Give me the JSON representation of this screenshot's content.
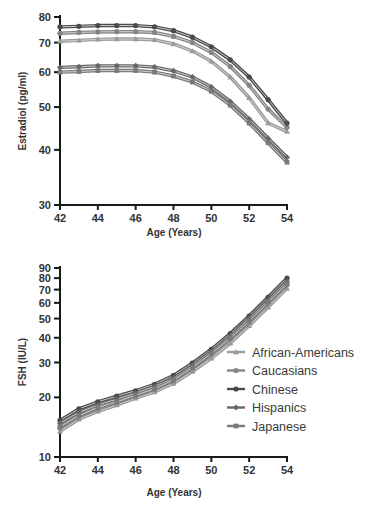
{
  "chart_data": [
    {
      "type": "line",
      "title": "",
      "xlabel": "Age (Years)",
      "ylabel": "Estradiol (pg/ml)",
      "yscale": "log",
      "xlim": [
        42,
        54
      ],
      "ylim": [
        30,
        80
      ],
      "xticks": [
        42,
        44,
        46,
        48,
        50,
        52,
        54
      ],
      "yticks": [
        30,
        40,
        50,
        60,
        70,
        80
      ],
      "grid": false,
      "x": [
        42,
        43,
        44,
        45,
        46,
        47,
        48,
        49,
        50,
        51,
        52,
        53,
        54
      ],
      "series": [
        {
          "name": "African-Americans",
          "values": [
            70.5,
            70.8,
            71.2,
            71.3,
            71.3,
            71.0,
            69.5,
            67.0,
            63.5,
            58.5,
            52.5,
            46.0,
            44.0
          ]
        },
        {
          "name": "Caucasians",
          "values": [
            73.5,
            73.8,
            74.0,
            74.1,
            74.1,
            73.8,
            72.3,
            70.0,
            66.5,
            61.8,
            56.0,
            49.5,
            45.0
          ]
        },
        {
          "name": "Chinese",
          "values": [
            76.0,
            76.2,
            76.5,
            76.5,
            76.5,
            76.0,
            74.5,
            72.0,
            68.5,
            64.0,
            58.5,
            52.0,
            46.0
          ]
        },
        {
          "name": "Hispanics",
          "values": [
            61.5,
            61.7,
            62.0,
            62.0,
            62.0,
            61.6,
            60.4,
            58.5,
            55.5,
            51.5,
            47.0,
            42.5,
            38.5
          ]
        },
        {
          "name": "Japanese",
          "values": [
            60.0,
            60.2,
            60.5,
            60.5,
            60.5,
            60.0,
            58.8,
            57.0,
            54.3,
            50.5,
            46.0,
            41.5,
            37.5
          ]
        }
      ]
    },
    {
      "type": "line",
      "title": "",
      "xlabel": "Age (Years)",
      "ylabel": "FSH (IU/L)",
      "yscale": "log",
      "xlim": [
        42,
        54
      ],
      "ylim": [
        10,
        90
      ],
      "xticks": [
        42,
        44,
        46,
        48,
        50,
        52,
        54
      ],
      "yticks": [
        10,
        20,
        30,
        40,
        50,
        60,
        70,
        80,
        90
      ],
      "grid": false,
      "legend": "right",
      "x": [
        42,
        43,
        44,
        45,
        46,
        47,
        48,
        49,
        50,
        51,
        52,
        53,
        54
      ],
      "series": [
        {
          "name": "African-Americans",
          "values": [
            13.5,
            15.5,
            17.0,
            18.3,
            19.8,
            21.3,
            23.5,
            27.0,
            31.5,
            37.5,
            46.0,
            57.0,
            71.0
          ]
        },
        {
          "name": "Caucasians",
          "values": [
            14.0,
            16.0,
            17.5,
            18.8,
            20.3,
            22.0,
            24.3,
            28.0,
            33.0,
            39.5,
            48.0,
            60.0,
            74.0
          ]
        },
        {
          "name": "Chinese",
          "values": [
            15.3,
            17.5,
            19.0,
            20.3,
            21.6,
            23.3,
            25.8,
            29.8,
            35.0,
            42.0,
            51.5,
            64.0,
            80.0
          ]
        },
        {
          "name": "Hispanics",
          "values": [
            14.8,
            16.8,
            18.3,
            19.6,
            21.0,
            22.7,
            25.0,
            29.0,
            34.0,
            40.8,
            50.0,
            62.0,
            77.0
          ]
        },
        {
          "name": "Japanese",
          "values": [
            14.2,
            16.2,
            17.8,
            19.0,
            20.5,
            22.1,
            24.5,
            28.3,
            33.3,
            39.8,
            48.5,
            60.5,
            75.0
          ]
        }
      ]
    }
  ],
  "legend": {
    "items": [
      {
        "label": "African-Americans",
        "color": "#9a9a9a",
        "marker": "triangle"
      },
      {
        "label": "Caucasians",
        "color": "#858585",
        "marker": "circle"
      },
      {
        "label": "Chinese",
        "color": "#4a4a4a",
        "marker": "circle"
      },
      {
        "label": "Hispanics",
        "color": "#666666",
        "marker": "diamond"
      },
      {
        "label": "Japanese",
        "color": "#7a7a7a",
        "marker": "square"
      }
    ]
  },
  "colors": {
    "African-Americans": "#9a9a9a",
    "Caucasians": "#858585",
    "Chinese": "#4a4a4a",
    "Hispanics": "#666666",
    "Japanese": "#7a7a7a"
  }
}
